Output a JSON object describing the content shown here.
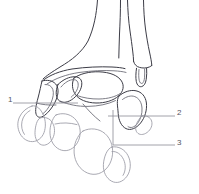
{
  "figure": {
    "width": 199,
    "height": 194,
    "background_color": "#ffffff",
    "style": "line-art anatomical illustration",
    "stroke_colors": {
      "dark": "#3c3c46",
      "mid": "#6e6e78",
      "light": "#9a9aa4",
      "leader": "#8c8c94"
    }
  },
  "callouts": [
    {
      "id": 1,
      "label": "1",
      "side": "left",
      "label_x": 8,
      "label_y": 96,
      "leader_from": [
        13,
        103
      ],
      "leader_to": [
        78,
        103
      ],
      "leader_type": "straight-horizontal"
    },
    {
      "id": 2,
      "label": "2",
      "side": "right",
      "label_x": 177,
      "label_y": 109,
      "leader_from": [
        175,
        116
      ],
      "leader_to": [
        108,
        116
      ],
      "leader_type": "straight-horizontal"
    },
    {
      "id": 3,
      "label": "3",
      "side": "right",
      "label_x": 177,
      "label_y": 139,
      "leader_from": [
        175,
        145
      ],
      "leader_to": [
        113,
        110
      ],
      "leader_type": "elbow-horizontal-then-vertical"
    }
  ],
  "structures": [
    {
      "name": "tibia",
      "region": "upper-center"
    },
    {
      "name": "fibula",
      "region": "upper-right"
    },
    {
      "name": "lateral-malleolus",
      "region": "upper-right-tip"
    },
    {
      "name": "talus",
      "region": "mid-center"
    },
    {
      "name": "navicular",
      "region": "mid-left"
    },
    {
      "name": "calcaneus",
      "region": "lower-left"
    },
    {
      "name": "cuboid",
      "region": "mid-right"
    },
    {
      "name": "cuneiform",
      "region": "lower-center"
    },
    {
      "name": "metatarsal-base",
      "region": "lower-right"
    }
  ]
}
